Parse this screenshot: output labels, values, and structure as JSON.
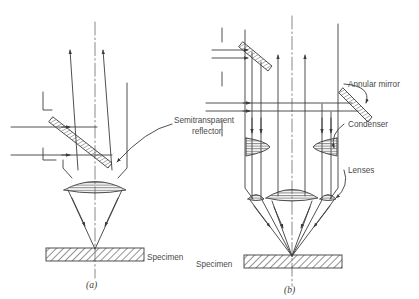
{
  "figure": {
    "background_color": "#ffffff",
    "line_color": "#3c3c3c",
    "text_color": "#4a4a4a",
    "hatch_color": "#6e6e6e"
  },
  "panels": [
    {
      "id": "a",
      "caption": "(a)",
      "specimen_label": "Specimen",
      "labels": [
        {
          "name": "semitransparent-reflector",
          "line1": "Semitransparent",
          "line2": "reflector"
        }
      ]
    },
    {
      "id": "b",
      "caption": "(b)",
      "specimen_label": "Specimen",
      "labels": [
        {
          "name": "annular-mirror",
          "text": "Annular mirror"
        },
        {
          "name": "condenser",
          "text": "Condenser"
        },
        {
          "name": "lenses",
          "text": "Lenses"
        }
      ]
    }
  ],
  "components": {
    "optical_axis": "dash-dot vertical centerline",
    "objective_lens": "biconvex lens with horizontal hatch fill",
    "condenser_lens": "half lens with horizontal hatch fill",
    "mirror": "hatched inclined plate",
    "specimen": "diagonally hatched horizontal bar",
    "ray": "thin line with open arrowhead"
  }
}
